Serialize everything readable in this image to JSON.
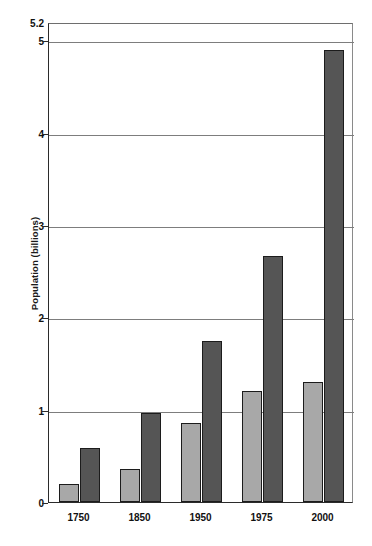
{
  "chart_data": {
    "type": "bar",
    "title": "",
    "xlabel": "",
    "ylabel": "Population (billions)",
    "categories": [
      "1750",
      "1850",
      "1950",
      "1975",
      "2000"
    ],
    "series": [
      {
        "name": "light-gray-series",
        "color": "#a8a8a8",
        "values": [
          0.2,
          0.36,
          0.86,
          1.2,
          1.3
        ]
      },
      {
        "name": "dark-gray-series",
        "color": "#555555",
        "values": [
          0.58,
          0.96,
          1.74,
          2.67,
          4.9
        ]
      }
    ],
    "ylim": [
      0,
      5.2
    ],
    "ytick_values": [
      0,
      1,
      2,
      3,
      4,
      5,
      5.2
    ],
    "ytick_labels": [
      "0",
      "1",
      "2",
      "3",
      "4",
      "5",
      "5.2"
    ],
    "gridlines_at": [
      1,
      2,
      3,
      4,
      5
    ],
    "grid": true,
    "legend": "none",
    "legend_position": "none"
  },
  "axis": {
    "y_title": "Population (billions)"
  },
  "colors": {
    "light_bar": "#a8a8a8",
    "dark_bar": "#555555",
    "axis": "#2b2b2b",
    "grid": "#7d7d7d",
    "background": "#ffffff"
  }
}
